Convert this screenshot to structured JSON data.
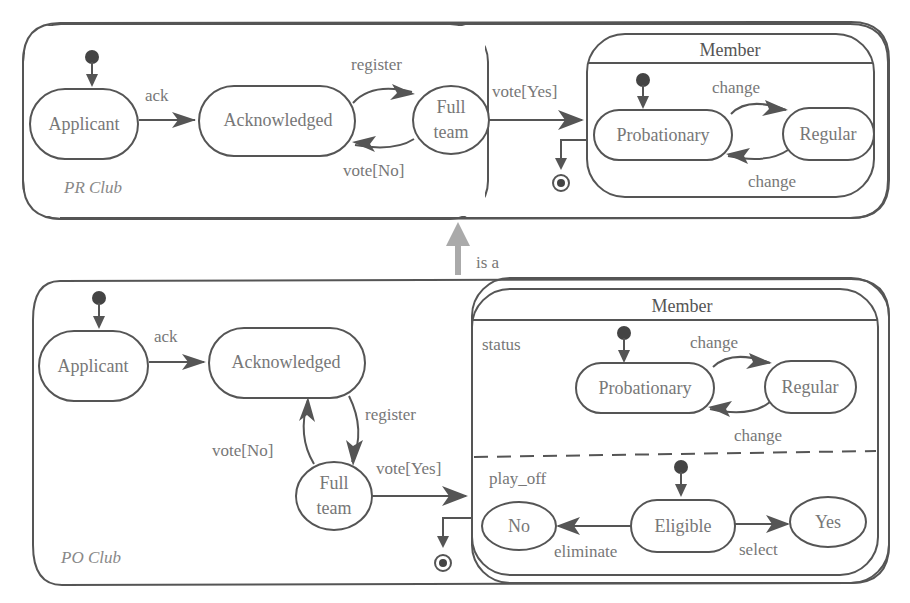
{
  "diagram": {
    "type": "UML statechart",
    "relation": {
      "label": "is a",
      "from": "PO Club",
      "to": "PR Club"
    },
    "pr_club": {
      "name": "PR Club",
      "states": [
        "Applicant",
        "Acknowledged",
        "Full team",
        "Member"
      ],
      "full_team_lines": [
        "Full",
        "team"
      ],
      "member": {
        "title": "Member",
        "substates": [
          "Probationary",
          "Regular"
        ]
      },
      "transitions": [
        {
          "from": "initial",
          "to": "Applicant",
          "label": ""
        },
        {
          "from": "Applicant",
          "to": "Acknowledged",
          "label": "ack"
        },
        {
          "from": "Acknowledged",
          "to": "Full team",
          "label": "register"
        },
        {
          "from": "Full team",
          "to": "Acknowledged",
          "label": "vote[No]"
        },
        {
          "from": "Full team",
          "to": "Member",
          "label": "vote[Yes]"
        },
        {
          "from": "Probationary",
          "to": "Regular",
          "label": "change"
        },
        {
          "from": "Regular",
          "to": "Probationary",
          "label": "change"
        },
        {
          "from": "Member",
          "to": "final",
          "label": ""
        }
      ]
    },
    "po_club": {
      "name": "PO Club",
      "states": [
        "Applicant",
        "Acknowledged",
        "Full team",
        "Member"
      ],
      "full_team_lines": [
        "Full",
        "team"
      ],
      "member": {
        "title": "Member",
        "regions": [
          {
            "name": "status",
            "substates": [
              "Probationary",
              "Regular"
            ]
          },
          {
            "name": "play_off",
            "substates": [
              "No",
              "Eligible",
              "Yes"
            ]
          }
        ]
      },
      "transitions": [
        {
          "from": "initial",
          "to": "Applicant",
          "label": ""
        },
        {
          "from": "Applicant",
          "to": "Acknowledged",
          "label": "ack"
        },
        {
          "from": "Acknowledged",
          "to": "Full team",
          "label": "register"
        },
        {
          "from": "Full team",
          "to": "Acknowledged",
          "label": "vote[No]"
        },
        {
          "from": "Full team",
          "to": "Member",
          "label": "vote[Yes]"
        },
        {
          "from": "Probationary",
          "to": "Regular",
          "label": "change"
        },
        {
          "from": "Regular",
          "to": "Probationary",
          "label": "change"
        },
        {
          "from": "Eligible",
          "to": "No",
          "label": "eliminate"
        },
        {
          "from": "Eligible",
          "to": "Yes",
          "label": "select"
        },
        {
          "from": "Member",
          "to": "final",
          "label": ""
        }
      ]
    }
  },
  "labels": {
    "pr_club": "PR Club",
    "po_club": "PO Club",
    "applicant": "Applicant",
    "acknowledged": "Acknowledged",
    "full": "Full",
    "team": "team",
    "member": "Member",
    "probationary": "Probationary",
    "regular": "Regular",
    "ack": "ack",
    "register": "register",
    "vote_no": "vote[No]",
    "vote_yes": "vote[Yes]",
    "change": "change",
    "is_a": "is a",
    "status": "status",
    "play_off": "play_off",
    "no": "No",
    "eligible": "Eligible",
    "yes": "Yes",
    "eliminate": "eliminate",
    "select": "select"
  }
}
